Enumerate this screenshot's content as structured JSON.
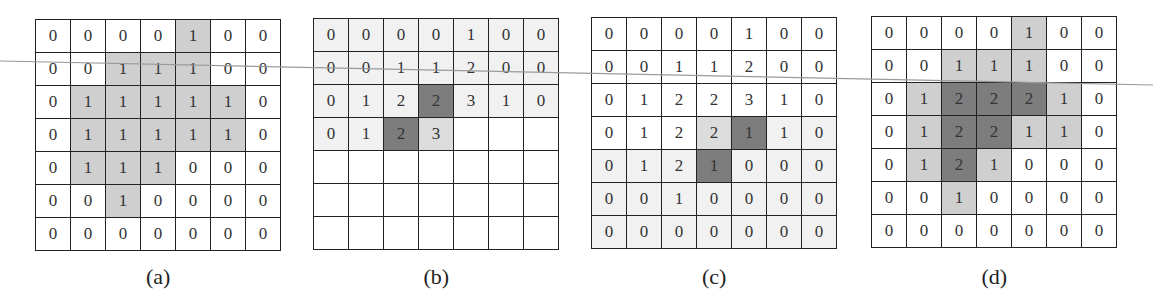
{
  "colors": {
    "white": "#ffffff",
    "very_light": "#f1f1f1",
    "light": "#cfcfcf",
    "medium_light": "#dcdcdc",
    "dark": "#7d7d7d",
    "grid_line": "#222222",
    "overlay_line": "#9a9a9a"
  },
  "panels": [
    {
      "id": "a",
      "caption": "(a)",
      "left": 35,
      "top": 19,
      "values": [
        [
          "0",
          "0",
          "0",
          "0",
          "1",
          "0",
          "0"
        ],
        [
          "0",
          "0",
          "1",
          "1",
          "1",
          "0",
          "0"
        ],
        [
          "0",
          "1",
          "1",
          "1",
          "1",
          "1",
          "0"
        ],
        [
          "0",
          "1",
          "1",
          "1",
          "1",
          "1",
          "0"
        ],
        [
          "0",
          "1",
          "1",
          "1",
          "0",
          "0",
          "0"
        ],
        [
          "0",
          "0",
          "1",
          "0",
          "0",
          "0",
          "0"
        ],
        [
          "0",
          "0",
          "0",
          "0",
          "0",
          "0",
          "0"
        ]
      ],
      "shades": [
        [
          "w",
          "w",
          "w",
          "w",
          "l",
          "w",
          "w"
        ],
        [
          "w",
          "w",
          "l",
          "l",
          "l",
          "w",
          "w"
        ],
        [
          "w",
          "l",
          "l",
          "l",
          "l",
          "l",
          "w"
        ],
        [
          "w",
          "l",
          "l",
          "l",
          "l",
          "l",
          "w"
        ],
        [
          "w",
          "l",
          "l",
          "l",
          "w",
          "w",
          "w"
        ],
        [
          "w",
          "w",
          "l",
          "w",
          "w",
          "w",
          "w"
        ],
        [
          "w",
          "w",
          "w",
          "w",
          "w",
          "w",
          "w"
        ]
      ]
    },
    {
      "id": "b",
      "caption": "(b)",
      "left": 313,
      "top": 18,
      "values": [
        [
          "0",
          "0",
          "0",
          "0",
          "1",
          "0",
          "0"
        ],
        [
          "0",
          "0",
          "1",
          "1",
          "2",
          "0",
          "0"
        ],
        [
          "0",
          "1",
          "2",
          "2",
          "3",
          "1",
          "0"
        ],
        [
          "0",
          "1",
          "2",
          "3",
          "",
          "",
          ""
        ],
        [
          "",
          "",
          "",
          "",
          "",
          "",
          ""
        ],
        [
          "",
          "",
          "",
          "",
          "",
          "",
          ""
        ],
        [
          "",
          "",
          "",
          "",
          "",
          "",
          ""
        ]
      ],
      "shades": [
        [
          "v",
          "v",
          "v",
          "v",
          "v",
          "v",
          "v"
        ],
        [
          "v",
          "v",
          "v",
          "v",
          "v",
          "v",
          "v"
        ],
        [
          "v",
          "v",
          "v",
          "d",
          "v",
          "v",
          "v"
        ],
        [
          "v",
          "v",
          "d",
          "m",
          "w",
          "w",
          "w"
        ],
        [
          "w",
          "w",
          "w",
          "w",
          "w",
          "w",
          "w"
        ],
        [
          "w",
          "w",
          "w",
          "w",
          "w",
          "w",
          "w"
        ],
        [
          "w",
          "w",
          "w",
          "w",
          "w",
          "w",
          "w"
        ]
      ]
    },
    {
      "id": "c",
      "caption": "(c)",
      "left": 591,
      "top": 17,
      "values": [
        [
          "0",
          "0",
          "0",
          "0",
          "1",
          "0",
          "0"
        ],
        [
          "0",
          "0",
          "1",
          "1",
          "2",
          "0",
          "0"
        ],
        [
          "0",
          "1",
          "2",
          "2",
          "3",
          "1",
          "0"
        ],
        [
          "0",
          "1",
          "2",
          "2",
          "1",
          "1",
          "0"
        ],
        [
          "0",
          "1",
          "2",
          "1",
          "0",
          "0",
          "0"
        ],
        [
          "0",
          "0",
          "1",
          "0",
          "0",
          "0",
          "0"
        ],
        [
          "0",
          "0",
          "0",
          "0",
          "0",
          "0",
          "0"
        ]
      ],
      "shades": [
        [
          "w",
          "w",
          "w",
          "w",
          "w",
          "w",
          "w"
        ],
        [
          "w",
          "w",
          "w",
          "w",
          "w",
          "w",
          "w"
        ],
        [
          "w",
          "w",
          "w",
          "w",
          "w",
          "w",
          "w"
        ],
        [
          "w",
          "w",
          "w",
          "m",
          "d",
          "v",
          "v"
        ],
        [
          "v",
          "v",
          "v",
          "d",
          "v",
          "v",
          "v"
        ],
        [
          "v",
          "v",
          "v",
          "v",
          "v",
          "v",
          "v"
        ],
        [
          "v",
          "v",
          "v",
          "v",
          "v",
          "v",
          "v"
        ]
      ]
    },
    {
      "id": "d",
      "caption": "(d)",
      "left": 871,
      "top": 16,
      "values": [
        [
          "0",
          "0",
          "0",
          "0",
          "1",
          "0",
          "0"
        ],
        [
          "0",
          "0",
          "1",
          "1",
          "1",
          "0",
          "0"
        ],
        [
          "0",
          "1",
          "2",
          "2",
          "2",
          "1",
          "0"
        ],
        [
          "0",
          "1",
          "2",
          "2",
          "1",
          "1",
          "0"
        ],
        [
          "0",
          "1",
          "2",
          "1",
          "0",
          "0",
          "0"
        ],
        [
          "0",
          "0",
          "1",
          "0",
          "0",
          "0",
          "0"
        ],
        [
          "0",
          "0",
          "0",
          "0",
          "0",
          "0",
          "0"
        ]
      ],
      "shades": [
        [
          "w",
          "w",
          "w",
          "w",
          "l",
          "w",
          "w"
        ],
        [
          "w",
          "w",
          "l",
          "l",
          "l",
          "w",
          "w"
        ],
        [
          "w",
          "l",
          "D",
          "D",
          "D",
          "l",
          "w"
        ],
        [
          "w",
          "l",
          "D",
          "D",
          "l",
          "l",
          "w"
        ],
        [
          "w",
          "l",
          "D",
          "l",
          "w",
          "w",
          "w"
        ],
        [
          "w",
          "w",
          "l",
          "w",
          "w",
          "w",
          "w"
        ],
        [
          "w",
          "w",
          "w",
          "w",
          "w",
          "w",
          "w"
        ]
      ]
    }
  ],
  "overlay_line": {
    "x1": 0,
    "y1": 61,
    "x2": 1153,
    "y2": 85
  }
}
